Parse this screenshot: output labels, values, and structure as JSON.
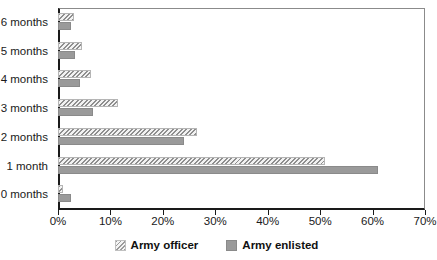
{
  "chart_data": {
    "type": "bar",
    "orientation": "horizontal",
    "title": "",
    "xlabel": "",
    "ylabel": "",
    "xlim": [
      0,
      70
    ],
    "xtick_labels": [
      "0%",
      "10%",
      "20%",
      "30%",
      "40%",
      "50%",
      "60%",
      "70%"
    ],
    "xtick_values": [
      0,
      10,
      20,
      30,
      40,
      50,
      60,
      70
    ],
    "grid": false,
    "legend_position": "bottom-center",
    "categories": [
      "0 months",
      "1 month",
      "2 months",
      "3 months",
      "4 months",
      "5 months",
      "6 months"
    ],
    "category_order_top_to_bottom": [
      "6 months",
      "5 months",
      "4 months",
      "3 months",
      "2 months",
      "1 month",
      "0 months"
    ],
    "series": [
      {
        "name": "Army officer",
        "pattern": "diagonal-hatch",
        "color": "#cfcfcf",
        "values": [
          1.0,
          51.0,
          26.5,
          11.5,
          6.2,
          4.5,
          3.0
        ]
      },
      {
        "name": "Army enlisted",
        "pattern": "solid",
        "color": "#9a9a9a",
        "values": [
          2.5,
          61.0,
          24.0,
          6.7,
          4.2,
          3.2,
          2.5
        ]
      }
    ]
  },
  "legend": {
    "items": [
      {
        "label": "Army officer",
        "swatch": "hatched-swatch-icon"
      },
      {
        "label": "Army enlisted",
        "swatch": "solid-swatch-icon"
      }
    ]
  }
}
